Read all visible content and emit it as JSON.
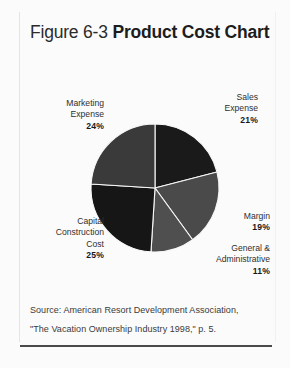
{
  "figure": {
    "number_label": "Figure 6-3",
    "title": "Product Cost Chart"
  },
  "source": {
    "line1": "Source: American Resort Development Association,",
    "line2": "\"The Vacation Ownership Industry 1998,\" p. 5."
  },
  "labels": {
    "sales": {
      "name_line1": "Sales",
      "name_line2": "Expense",
      "pct": "21%"
    },
    "marketing": {
      "name_line1": "Marketing",
      "name_line2": "Expense",
      "pct": "24%"
    },
    "capital": {
      "name_line1": "Capital",
      "name_line2": "Construction",
      "name_line3": "Cost",
      "pct": "25%"
    },
    "margin": {
      "name_line1": "Margin",
      "pct": "19%"
    },
    "general": {
      "name_line1": "General &",
      "name_line2": "Administrative",
      "pct": "11%"
    }
  },
  "chart_data": {
    "type": "pie",
    "title": "Product Cost Chart",
    "start_angle_deg": 0,
    "direction": "clockwise",
    "units": "percent",
    "center": {
      "x": 155,
      "y": 188
    },
    "radius": 64,
    "separator_color": "#f7f7f7",
    "legend": "inline-callout-labels",
    "labels": [
      "Sales Expense",
      "Margin",
      "General & Administrative",
      "Capital Construction Cost",
      "Marketing Expense"
    ],
    "values": [
      21,
      19,
      11,
      25,
      24
    ],
    "colors": [
      "#1a1a1a",
      "#4a4a4a",
      "#4f4f4f",
      "#161616",
      "#3a3a3a"
    ],
    "slices": [
      {
        "label": "Sales Expense",
        "value": 21,
        "color": "#1a1a1a"
      },
      {
        "label": "Margin",
        "value": 19,
        "color": "#4a4a4a"
      },
      {
        "label": "General & Administrative",
        "value": 11,
        "color": "#4f4f4f"
      },
      {
        "label": "Capital Construction Cost",
        "value": 25,
        "color": "#161616"
      },
      {
        "label": "Marketing Expense",
        "value": 24,
        "color": "#3a3a3a"
      }
    ],
    "total": 100
  }
}
